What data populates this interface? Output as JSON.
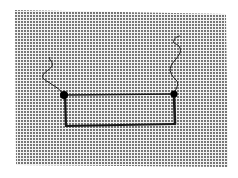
{
  "diagram": {
    "type": "circuit",
    "background": {
      "pattern": "halftone-dots",
      "dot_color": "#3a3a3a",
      "paper_color": "#f2f2f2"
    },
    "colors": {
      "line": "#1a1a1a",
      "junction": "#000000"
    },
    "junctions": [
      {
        "id": "left-junction",
        "x": 64,
        "y": 95
      },
      {
        "id": "right-junction",
        "x": 174,
        "y": 94
      }
    ],
    "loop": {
      "top_y": 95,
      "bottom_y": 125,
      "left_x": 65,
      "right_x": 175
    },
    "leads": [
      {
        "id": "left-lead",
        "from": "left-junction"
      },
      {
        "id": "right-lead",
        "from": "right-junction"
      }
    ]
  }
}
